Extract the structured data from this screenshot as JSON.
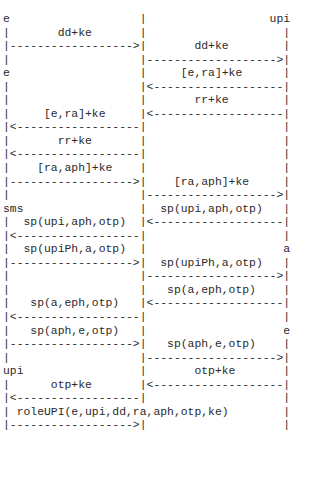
{
  "diagram": {
    "type": "ascii-sequence-diagram",
    "participants": [
      "e",
      "upi",
      "sms",
      "a"
    ],
    "lines": [
      "e                   |                  upi",
      "|       dd+ke       |                    |",
      "|------------------>|       dd+ke        |",
      "|                   |------------------->|",
      "e                   |     [e,ra]+ke      |",
      "|                   |<-------------------|",
      "|                   |       rr+ke        |",
      "|     [e,ra]+ke     |<-------------------|",
      "|<------------------|                    |",
      "|       rr+ke       |                    |",
      "|<------------------|                    |",
      "|    [ra,aph]+ke    |                    |",
      "|------------------>|    [ra,aph]+ke     |",
      "|                   |------------------->|",
      "sms                 |  sp(upi,aph,otp)   |",
      "|  sp(upi,aph,otp)  |<-------------------|",
      "|<------------------|                    |",
      "|  sp(upiPh,a,otp)  |                    a",
      "|------------------>|  sp(upiPh,a,otp)   |",
      "|                   |------------------->|",
      "|                   |   sp(a,eph,otp)    |",
      "|   sp(a,eph,otp)   |<-------------------|",
      "|<------------------|                    |",
      "|   sp(aph,e,otp)   |                    e",
      "|------------------>|   sp(aph,e,otp)    |",
      "|                   |------------------->|",
      "upi                 |       otp+ke       |",
      "|      otp+ke       |<-------------------|",
      "|<------------------|                    |",
      "| roleUPI(e,upi,dd,ra,aph,otp,ke)        |",
      "|------------------>|                    |"
    ],
    "messages": [
      {
        "from": "e",
        "to": "mid",
        "label": "dd+ke"
      },
      {
        "from": "mid",
        "to": "upi",
        "label": "dd+ke"
      },
      {
        "from": "upi",
        "to": "mid",
        "label": "[e,ra]+ke"
      },
      {
        "from": "upi",
        "to": "mid",
        "label": "rr+ke"
      },
      {
        "from": "mid",
        "to": "e",
        "label": "[e,ra]+ke"
      },
      {
        "from": "mid",
        "to": "e",
        "label": "rr+ke"
      },
      {
        "from": "e",
        "to": "mid",
        "label": "[ra,aph]+ke"
      },
      {
        "from": "mid",
        "to": "upi",
        "label": "[ra,aph]+ke"
      },
      {
        "from": "upi",
        "to": "mid",
        "label": "sp(upi,aph,otp)"
      },
      {
        "from": "mid",
        "to": "sms",
        "label": "sp(upi,aph,otp)"
      },
      {
        "from": "sms",
        "to": "mid",
        "label": "sp(upiPh,a,otp)"
      },
      {
        "from": "mid",
        "to": "a",
        "label": "sp(upiPh,a,otp)"
      },
      {
        "from": "a",
        "to": "mid",
        "label": "sp(a,eph,otp)"
      },
      {
        "from": "mid",
        "to": "sms",
        "label": "sp(a,eph,otp)"
      },
      {
        "from": "sms",
        "to": "mid",
        "label": "sp(aph,e,otp)"
      },
      {
        "from": "mid",
        "to": "e",
        "label": "sp(aph,e,otp)"
      },
      {
        "from": "e",
        "to": "mid",
        "label": "otp+ke"
      },
      {
        "from": "mid",
        "to": "upi",
        "label": "otp+ke"
      },
      {
        "from": "upi",
        "to": "mid",
        "label": "roleUPI(e,upi,dd,ra,aph,otp,ke)"
      }
    ]
  }
}
